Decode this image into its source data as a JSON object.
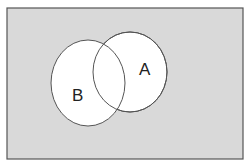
{
  "diagram": {
    "type": "venn",
    "universe": {
      "fill": "#d9d9d9",
      "stroke": "#555555"
    },
    "sets": [
      {
        "id": "A",
        "label": "A",
        "fill": "#ffffff"
      },
      {
        "id": "B",
        "label": "B",
        "fill": "#ffffff"
      }
    ]
  }
}
